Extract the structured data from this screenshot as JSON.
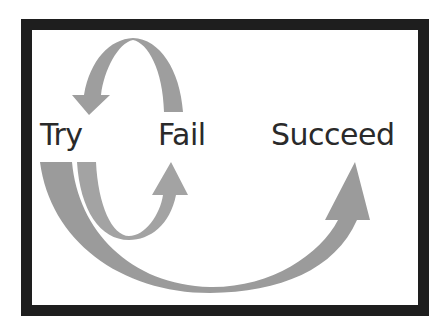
{
  "diagram": {
    "labels": {
      "try": "Try",
      "fail": "Fail",
      "succeed": "Succeed"
    },
    "colors": {
      "frame": "#1e1e1e",
      "arrow": "#999999",
      "text": "#2a2a2a"
    },
    "arrows": [
      {
        "from": "Fail",
        "to": "Try",
        "shape": "curved-over"
      },
      {
        "from": "Try",
        "to": "Fail",
        "shape": "curved-under"
      },
      {
        "from": "Try",
        "to": "Succeed",
        "shape": "curved-under-large"
      }
    ]
  }
}
